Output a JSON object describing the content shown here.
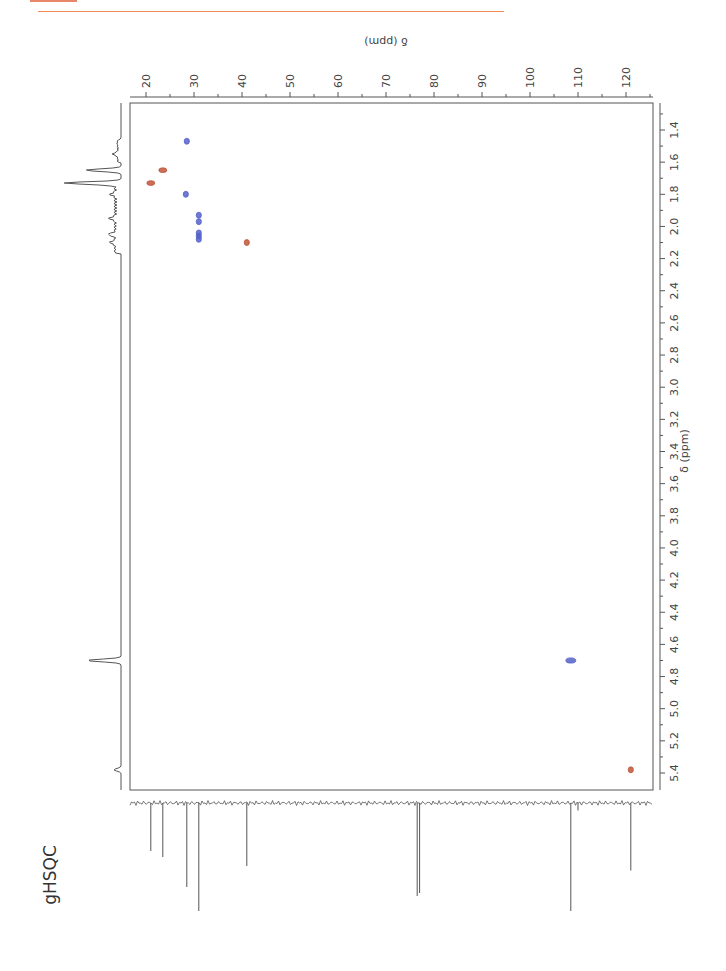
{
  "header": {
    "accent_color": "#ef8a5e"
  },
  "experiment_label": "gHSQC",
  "chart_data": {
    "type": "scatter",
    "subtype": "2D NMR gHSQC contour plot (page rotated 90°)",
    "title": "gHSQC",
    "xlabel": "δ (ppm)",
    "ylabel": "δ (ppm)",
    "f2_axis": {
      "nucleus": "1H",
      "label": "δ (ppm)",
      "range": [
        1.25,
        5.5
      ],
      "ticks": [
        1.4,
        1.6,
        1.8,
        2.0,
        2.2,
        2.4,
        2.6,
        2.8,
        3.0,
        3.2,
        3.4,
        3.6,
        3.8,
        4.0,
        4.2,
        4.4,
        4.6,
        4.8,
        5.0,
        5.2,
        5.4
      ],
      "tick_labels": [
        "1.4",
        "1.6",
        "1.8",
        "2.0",
        "2.2",
        "2.4",
        "2.6",
        "2.8",
        "3.0",
        "3.2",
        "3.4",
        "3.6",
        "3.8",
        "4.0",
        "4.2",
        "4.4",
        "4.6",
        "4.8",
        "5.0",
        "5.2",
        "5.4"
      ]
    },
    "f1_axis": {
      "nucleus": "13C",
      "label": "δ (ppm)",
      "range": [
        16.5,
        125.5
      ],
      "ticks": [
        20,
        30,
        40,
        50,
        60,
        70,
        80,
        90,
        100,
        110,
        120
      ],
      "tick_labels": [
        "20",
        "30",
        "40",
        "50",
        "60",
        "70",
        "80",
        "90",
        "100",
        "110",
        "120"
      ]
    },
    "series": [
      {
        "name": "CH/CH3 (positive phase)",
        "color": "#5561c9",
        "points": [
          {
            "h": 1.47,
            "c": 28.5
          },
          {
            "h": 1.8,
            "c": 28.3
          },
          {
            "h": 1.93,
            "c": 31.0
          },
          {
            "h": 1.97,
            "c": 31.0
          },
          {
            "h": 2.04,
            "c": 31.0
          },
          {
            "h": 2.06,
            "c": 31.0
          },
          {
            "h": 2.08,
            "c": 31.0
          },
          {
            "h": 4.7,
            "c": 108.5
          }
        ]
      },
      {
        "name": "CH2 (negative phase)",
        "color": "#c0553a",
        "points": [
          {
            "h": 1.65,
            "c": 23.5
          },
          {
            "h": 1.73,
            "c": 21.0
          },
          {
            "h": 2.1,
            "c": 41.0
          },
          {
            "h": 5.38,
            "c": 121.0
          }
        ]
      }
    ],
    "projections": {
      "f2_1H_peaks_ppm": [
        1.47,
        1.55,
        1.65,
        1.73,
        1.8,
        1.95,
        2.05,
        2.1,
        4.7,
        5.38
      ],
      "f1_13C_peaks": [
        {
          "c": 21.0,
          "rel": 0.32
        },
        {
          "c": 23.5,
          "rel": 0.36
        },
        {
          "c": 28.5,
          "rel": 0.56
        },
        {
          "c": 31.0,
          "rel": 0.72
        },
        {
          "c": 41.0,
          "rel": 0.42
        },
        {
          "c": 76.5,
          "rel": 0.62
        },
        {
          "c": 77.0,
          "rel": 0.6
        },
        {
          "c": 108.5,
          "rel": 0.72
        },
        {
          "c": 110.0,
          "rel": 0.05
        },
        {
          "c": 121.0,
          "rel": 0.45
        }
      ]
    },
    "grid": false,
    "legend": null
  }
}
